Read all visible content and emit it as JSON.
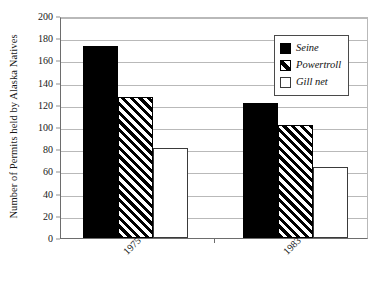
{
  "chart_data": {
    "type": "bar",
    "title": "",
    "subtitle": "",
    "xlabel": "",
    "ylabel": "Number of Permits held by Alaska Natives",
    "categories": [
      "1975",
      "1983"
    ],
    "series": [
      {
        "name": "Seine",
        "values": [
          173,
          122
        ],
        "fill": "solid-black",
        "color": "#000000"
      },
      {
        "name": "Powertroll",
        "values": [
          127,
          102
        ],
        "fill": "diagonal-hatch",
        "color": "#000000"
      },
      {
        "name": "Gill net",
        "values": [
          81,
          64
        ],
        "fill": "white",
        "color": "#ffffff"
      }
    ],
    "ylim": [
      0,
      200
    ],
    "ytick_values": [
      0,
      20,
      40,
      60,
      80,
      100,
      120,
      140,
      160,
      180,
      200
    ],
    "ytick_labels": [
      "0",
      "20",
      "40",
      "60",
      "80",
      "100",
      "120",
      "140",
      "160",
      "180",
      "200"
    ],
    "grid": true,
    "grid_axis": "y",
    "grid_color": "#b9b9b9",
    "legend_position": "top-right",
    "xtick_label_rotation": -45,
    "background_color": "#ffffff",
    "axis_color": "#6d6d6d",
    "annotations": []
  },
  "legend": {
    "items": [
      {
        "label": "Seine",
        "swatch": "solid-black-swatch"
      },
      {
        "label": "Powertroll",
        "swatch": "diagonal-hatch-swatch"
      },
      {
        "label": "Gill net",
        "swatch": "white-swatch"
      }
    ]
  }
}
